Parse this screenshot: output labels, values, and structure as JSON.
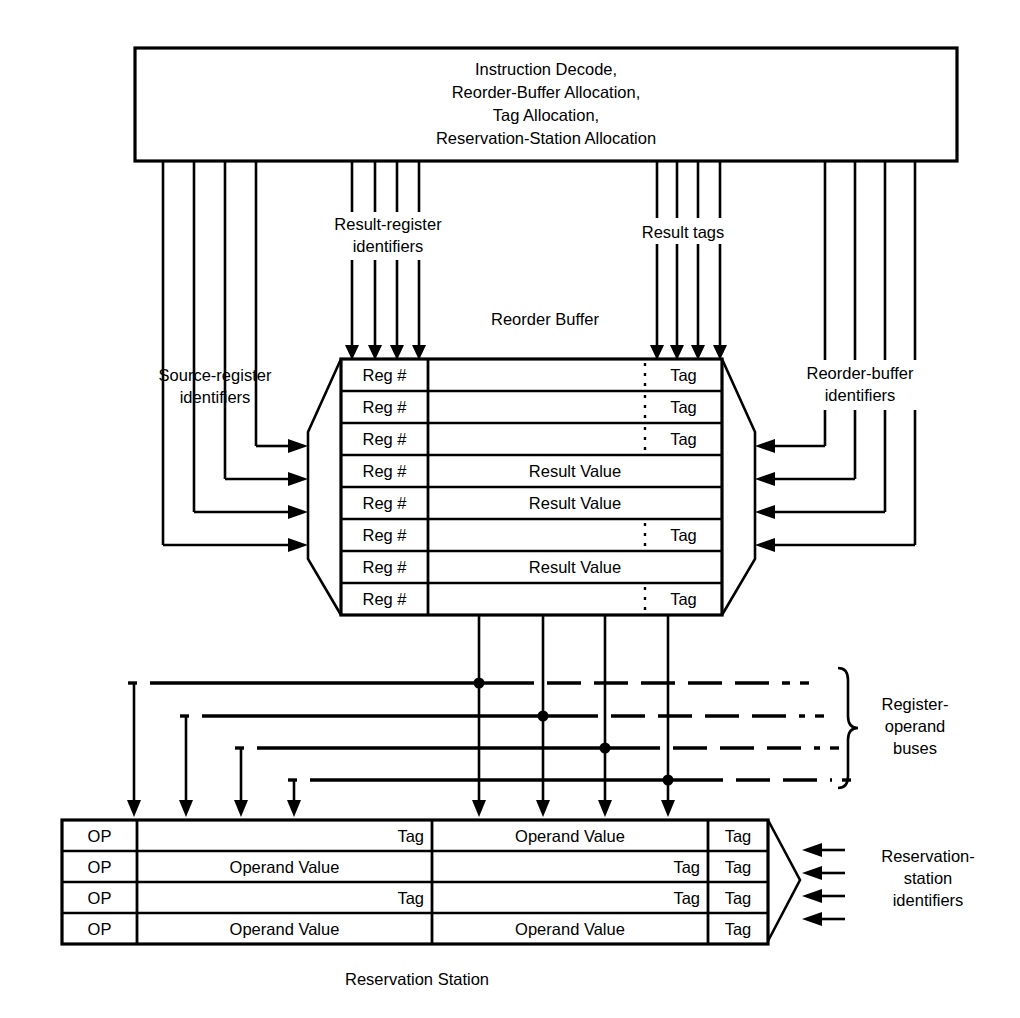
{
  "diagram": {
    "caption": "Reservation Station",
    "decode_box": {
      "lines": [
        "Instruction Decode,",
        "Reorder-Buffer Allocation,",
        "Tag Allocation,",
        "Reservation-Station Allocation"
      ]
    },
    "labels": {
      "source_register": [
        "Source-register",
        "identifiers"
      ],
      "result_register": [
        "Result-register",
        "identifiers"
      ],
      "result_tags": [
        "Result tags"
      ],
      "reorder_buffer_ids": [
        "Reorder-buffer",
        "identifiers"
      ],
      "reorder_buffer_title": "Reorder Buffer",
      "register_operand_buses": [
        "Register-",
        "operand",
        "buses"
      ],
      "reservation_station_ids": [
        "Reservation-",
        "station",
        "identifiers"
      ]
    },
    "reorder_buffer": {
      "title": "Reorder Buffer",
      "reg_label": "Reg #",
      "tag_label": "Tag",
      "value_label": "Result Value",
      "rows": [
        {
          "reg": "Reg #",
          "kind": "tag",
          "text": "Tag"
        },
        {
          "reg": "Reg #",
          "kind": "tag",
          "text": "Tag"
        },
        {
          "reg": "Reg #",
          "kind": "tag",
          "text": "Tag"
        },
        {
          "reg": "Reg #",
          "kind": "value",
          "text": "Result Value"
        },
        {
          "reg": "Reg #",
          "kind": "value",
          "text": "Result Value"
        },
        {
          "reg": "Reg #",
          "kind": "tag",
          "text": "Tag"
        },
        {
          "reg": "Reg #",
          "kind": "value",
          "text": "Result Value"
        },
        {
          "reg": "Reg #",
          "kind": "tag",
          "text": "Tag"
        }
      ]
    },
    "reservation_station": {
      "op_label": "OP",
      "tag_label": "Tag",
      "value_label": "Operand Value",
      "rows": [
        {
          "op": "OP",
          "f1_kind": "tag",
          "f1": "Tag",
          "f2_kind": "value",
          "f2": "Operand Value",
          "tag": "Tag"
        },
        {
          "op": "OP",
          "f1_kind": "value",
          "f1": "Operand Value",
          "f2_kind": "tag",
          "f2": "Tag",
          "tag": "Tag"
        },
        {
          "op": "OP",
          "f1_kind": "tag",
          "f1": "Tag",
          "f2_kind": "tag",
          "f2": "Tag",
          "tag": "Tag"
        },
        {
          "op": "OP",
          "f1_kind": "value",
          "f1": "Operand Value",
          "f2_kind": "value",
          "f2": "Operand Value",
          "tag": "Tag"
        }
      ]
    },
    "counts": {
      "source_register_lines": 4,
      "result_register_lines": 4,
      "result_tag_lines": 4,
      "reorder_buffer_id_lines": 4,
      "register_operand_buses": 4,
      "reservation_station_id_arrows": 4
    },
    "colors": {
      "stroke": "#000000",
      "background": "#ffffff"
    }
  }
}
